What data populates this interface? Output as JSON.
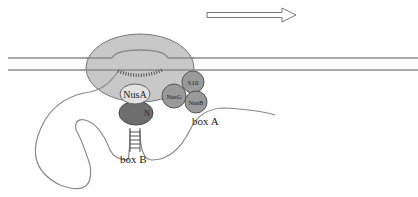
{
  "diagram": {
    "labels": {
      "nusA": "NusA",
      "nusG": "NusG",
      "s10": "S10",
      "nusB": "NusB",
      "n_protein": "N",
      "box_a": "box A",
      "box_b": "box B"
    },
    "colors": {
      "rnap_fill": "#c8c8c8",
      "nusA_fill": "#e2e2e2",
      "nus_circles_fill": "#9a9a9a",
      "n_protein_fill": "#6e6e6e",
      "line": "#8a8a8a"
    },
    "arrow": {
      "direction": "right"
    }
  }
}
